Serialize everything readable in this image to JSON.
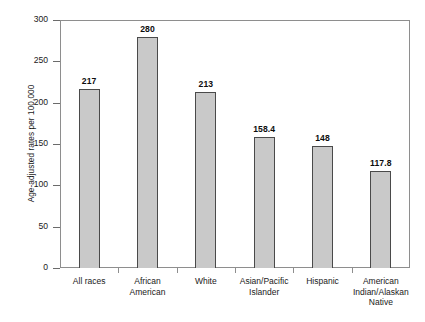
{
  "chart_data": {
    "type": "bar",
    "title": "",
    "xlabel": "",
    "ylabel": "Age-adjusted rates per 100,000",
    "ylim": [
      0,
      300
    ],
    "ytick_labels": [
      "0",
      "50",
      "100",
      "150",
      "200",
      "250",
      "300"
    ],
    "ytick_values": [
      0,
      50,
      100,
      150,
      200,
      250,
      300
    ],
    "grid": false,
    "legend": "none",
    "categories": [
      "All races",
      "African American",
      "White",
      "Asian/Pacific Islander",
      "Hispanic",
      "American Indian/Alaskan Native"
    ],
    "values": [
      217,
      280,
      213,
      158.4,
      148,
      117.8
    ],
    "value_labels": [
      "217",
      "280",
      "213",
      "158.4",
      "148",
      "117.8"
    ],
    "bars": [
      {
        "label": "All races",
        "label_lines": [
          "All races"
        ],
        "value": 217,
        "value_label": "217"
      },
      {
        "label": "African American",
        "label_lines": [
          "African",
          "American"
        ],
        "value": 280,
        "value_label": "280"
      },
      {
        "label": "White",
        "label_lines": [
          "White"
        ],
        "value": 213,
        "value_label": "213"
      },
      {
        "label": "Asian/Pacific Islander",
        "label_lines": [
          "Asian/Pacific",
          "Islander"
        ],
        "value": 158.4,
        "value_label": "158.4"
      },
      {
        "label": "Hispanic",
        "label_lines": [
          "Hispanic"
        ],
        "value": 148,
        "value_label": "148"
      },
      {
        "label": "American Indian/Alaskan Native",
        "label_lines": [
          "American",
          "Indian/Alaskan",
          "Native"
        ],
        "value": 117.8,
        "value_label": "117.8"
      }
    ],
    "colors": {
      "bar_fill": "#c9c9c9",
      "bar_border": "#4a4a4a",
      "frame": "#8e8e8e",
      "text": "#1a1a1a",
      "background": "#ffffff"
    }
  }
}
